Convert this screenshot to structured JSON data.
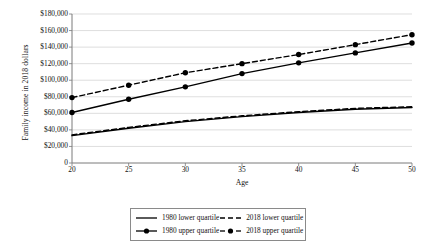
{
  "chart_data": {
    "type": "line",
    "title": "",
    "xlabel": "Age",
    "ylabel": "Family income in 2018 dollars",
    "x": [
      20,
      25,
      30,
      35,
      40,
      45,
      50
    ],
    "xlim": [
      20,
      50
    ],
    "ylim": [
      0,
      180000
    ],
    "ytick_step": 20000,
    "grid": true,
    "legend_position": "bottom",
    "xtick_labels": [
      "20",
      "25",
      "30",
      "35",
      "40",
      "45",
      "50"
    ],
    "ytick_labels": [
      "0",
      "$20,000",
      "$40,000",
      "$60,000",
      "$80,000",
      "$100,000",
      "$120,000",
      "$140,000",
      "$160,000",
      "$180,000"
    ],
    "ytick_values": [
      0,
      20000,
      40000,
      60000,
      80000,
      100000,
      120000,
      140000,
      160000,
      180000
    ],
    "series": [
      {
        "name": "1980 lower quartile",
        "style": "solid",
        "markers": false,
        "color": "#000000",
        "values": [
          33000,
          42000,
          50000,
          56000,
          61000,
          65000,
          67000
        ]
      },
      {
        "name": "2018 lower quartile",
        "style": "dashed",
        "markers": false,
        "color": "#000000",
        "values": [
          34000,
          43000,
          51000,
          57000,
          62000,
          66000,
          68000
        ]
      },
      {
        "name": "1980 upper quartile",
        "style": "solid",
        "markers": true,
        "color": "#000000",
        "values": [
          61000,
          77000,
          92000,
          108000,
          121000,
          133000,
          145000
        ]
      },
      {
        "name": "2018 upper quartile",
        "style": "dashed",
        "markers": true,
        "color": "#000000",
        "values": [
          79000,
          94000,
          109000,
          120000,
          131000,
          143000,
          155000
        ]
      }
    ]
  },
  "legend": {
    "rows": [
      {
        "left": "1980 lower quartile",
        "right": "2018 lower quartile"
      },
      {
        "left": "1980 upper quartile",
        "right": "2018 upper quartile"
      }
    ]
  }
}
